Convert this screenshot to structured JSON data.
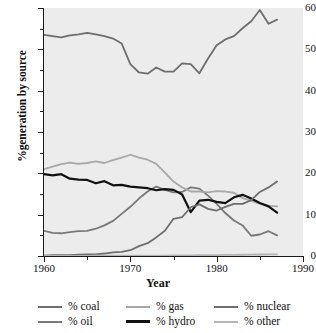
{
  "chart_data": {
    "type": "line",
    "title": "",
    "xlabel": "Year",
    "ylabel": "%generation by source",
    "xlim": [
      1960,
      1990
    ],
    "ylim": [
      0,
      60
    ],
    "xticks": [
      1960,
      1970,
      1980,
      1990
    ],
    "xticks_minor": [
      1965,
      1975,
      1985
    ],
    "yticks": [
      0,
      10,
      20,
      30,
      40,
      50,
      60
    ],
    "yticks_minor": [
      5,
      15,
      25,
      35,
      45,
      55
    ],
    "grid": false,
    "legend_position": "bottom",
    "plot_background": "#ececec",
    "x": [
      1960,
      1961,
      1962,
      1963,
      1964,
      1965,
      1966,
      1967,
      1968,
      1969,
      1970,
      1971,
      1972,
      1973,
      1974,
      1975,
      1976,
      1977,
      1978,
      1979,
      1980,
      1981,
      1982,
      1983,
      1984,
      1985,
      1986,
      1987
    ],
    "series": [
      {
        "name": "% coal",
        "color": "#6e6e6e",
        "width": 1.8,
        "values": [
          53.5,
          53.2,
          52.9,
          53.4,
          53.6,
          54.0,
          53.6,
          53.2,
          52.6,
          51.4,
          46.4,
          44.4,
          44.1,
          45.6,
          44.6,
          44.6,
          46.6,
          46.4,
          44.2,
          47.8,
          51.0,
          52.4,
          53.2,
          55.1,
          56.8,
          59.5,
          56.2,
          57.2
        ]
      },
      {
        "name": "% oil",
        "color": "#787878",
        "width": 1.8,
        "values": [
          6.1,
          5.6,
          5.5,
          5.8,
          6.0,
          6.1,
          6.6,
          7.4,
          8.5,
          10.2,
          11.9,
          13.9,
          15.6,
          16.8,
          16.0,
          15.4,
          15.5,
          16.6,
          16.3,
          14.6,
          12.6,
          10.4,
          8.6,
          7.4,
          4.9,
          5.2,
          6.0,
          5.0
        ]
      },
      {
        "name": "% gas",
        "color": "#a8a8a8",
        "width": 1.8,
        "values": [
          21.0,
          21.6,
          22.2,
          22.6,
          22.3,
          22.5,
          22.9,
          22.5,
          23.2,
          23.8,
          24.5,
          23.8,
          23.3,
          22.3,
          20.2,
          18.0,
          16.6,
          15.6,
          15.6,
          15.4,
          15.7,
          15.6,
          15.3,
          14.0,
          13.4,
          12.6,
          12.2,
          12.0
        ]
      },
      {
        "name": "% hydro",
        "color": "#111111",
        "width": 2.2,
        "values": [
          19.8,
          19.5,
          19.8,
          18.7,
          18.5,
          18.4,
          17.6,
          18.1,
          17.1,
          17.2,
          16.8,
          16.6,
          16.4,
          15.9,
          16.2,
          16.0,
          14.9,
          10.6,
          13.4,
          13.6,
          13.1,
          12.8,
          14.2,
          14.8,
          13.9,
          12.8,
          12.0,
          10.5
        ]
      },
      {
        "name": "% nuclear",
        "color": "#6e6e6e",
        "width": 1.8,
        "values": [
          0.1,
          0.2,
          0.2,
          0.2,
          0.3,
          0.4,
          0.4,
          0.6,
          0.9,
          1.0,
          1.4,
          2.4,
          3.1,
          4.5,
          6.1,
          9.0,
          9.4,
          11.8,
          12.5,
          11.4,
          11.0,
          11.9,
          12.6,
          12.6,
          13.5,
          15.5,
          16.6,
          18.0
        ]
      },
      {
        "name": "% other",
        "color": "#b4b4b4",
        "width": 1.8,
        "values": [
          0.05,
          0.05,
          0.05,
          0.05,
          0.05,
          0.05,
          0.06,
          0.06,
          0.07,
          0.07,
          0.08,
          0.08,
          0.09,
          0.1,
          0.11,
          0.12,
          0.14,
          0.16,
          0.18,
          0.2,
          0.22,
          0.25,
          0.28,
          0.3,
          0.33,
          0.36,
          0.38,
          0.4
        ]
      }
    ]
  },
  "axes": {
    "y_title": "%generation by source",
    "x_title": "Year",
    "y_labels": [
      "0",
      "10",
      "20",
      "30",
      "40",
      "50",
      "60"
    ],
    "x_labels": [
      "1960",
      "1970",
      "1980",
      "1990"
    ]
  },
  "legend": {
    "rows": [
      [
        {
          "label": "% coal",
          "color": "#6e6e6e",
          "thick": false
        },
        {
          "label": "% gas",
          "color": "#a8a8a8",
          "thick": false
        },
        {
          "label": "% nuclear",
          "color": "#6e6e6e",
          "thick": false
        }
      ],
      [
        {
          "label": "% oil",
          "color": "#787878",
          "thick": false
        },
        {
          "label": "% hydro",
          "color": "#111111",
          "thick": true
        },
        {
          "label": "% other",
          "color": "#b4b4b4",
          "thick": false
        }
      ]
    ]
  }
}
